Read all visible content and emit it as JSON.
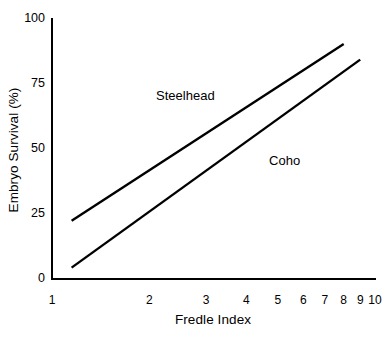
{
  "chart_data": {
    "type": "line",
    "title": "",
    "xlabel": "Fredle Index",
    "ylabel": "Embryo Survival (%)",
    "xscale": "log",
    "yscale": "linear",
    "xlim": [
      1,
      10
    ],
    "ylim": [
      0,
      100
    ],
    "grid": false,
    "legend_position": "inline-annotation",
    "xticks": [
      {
        "value": 1,
        "label": "1"
      },
      {
        "value": 2,
        "label": "2"
      },
      {
        "value": 3,
        "label": "3"
      },
      {
        "value": 4,
        "label": "4"
      },
      {
        "value": 5,
        "label": "5"
      },
      {
        "value": 6,
        "label": "6"
      },
      {
        "value": 7,
        "label": "7"
      },
      {
        "value": 8,
        "label": "8"
      },
      {
        "value": 9,
        "label": "9"
      },
      {
        "value": 10,
        "label": "10"
      }
    ],
    "yticks": [
      {
        "value": 0,
        "label": "0"
      },
      {
        "value": 25,
        "label": "25"
      },
      {
        "value": 50,
        "label": "50"
      },
      {
        "value": 75,
        "label": "75"
      },
      {
        "value": 100,
        "label": "100"
      }
    ],
    "series": [
      {
        "name": "Steelhead",
        "color": "#000000",
        "line_width": 2.4,
        "points": [
          {
            "x": 1.15,
            "y": 22
          },
          {
            "x": 8,
            "y": 90
          }
        ],
        "annotation": {
          "text": "Steelhead",
          "x": 2.1,
          "y": 73
        }
      },
      {
        "name": "Coho",
        "color": "#000000",
        "line_width": 2.4,
        "points": [
          {
            "x": 1.15,
            "y": 4
          },
          {
            "x": 9,
            "y": 84
          }
        ],
        "annotation": {
          "text": "Coho",
          "x": 4.7,
          "y": 48
        }
      }
    ]
  },
  "axes": {
    "axis_color": "#000000",
    "background": "#ffffff"
  }
}
